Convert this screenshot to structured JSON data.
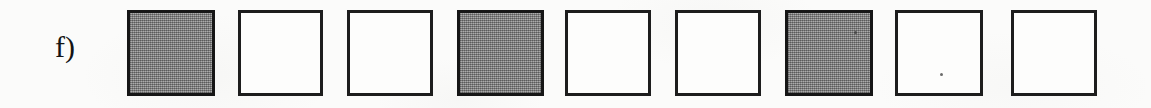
{
  "page": {
    "background_color": "#fbfbfa",
    "media": "scanned-worksheet"
  },
  "item": {
    "label": "f)",
    "ink_color": "#141414"
  },
  "legend": {
    "filled_color": "#8b8b8b",
    "empty_color": "#fdfdfc",
    "border_color": "#1d1d1d"
  },
  "pattern": {
    "type": "repeating-shaded-sequence",
    "period": 3,
    "count": 9,
    "squares": [
      {
        "index": 1,
        "state": "filled",
        "x": 127,
        "width": 88
      },
      {
        "index": 2,
        "state": "empty",
        "x": 238,
        "width": 85
      },
      {
        "index": 3,
        "state": "empty",
        "x": 347,
        "width": 86
      },
      {
        "index": 4,
        "state": "filled",
        "x": 457,
        "width": 87
      },
      {
        "index": 5,
        "state": "empty",
        "x": 565,
        "width": 86
      },
      {
        "index": 6,
        "state": "empty",
        "x": 675,
        "width": 86
      },
      {
        "index": 7,
        "state": "filled",
        "x": 785,
        "width": 88
      },
      {
        "index": 8,
        "state": "empty",
        "x": 895,
        "width": 88
      },
      {
        "index": 9,
        "state": "empty",
        "x": 1011,
        "width": 86
      }
    ]
  }
}
